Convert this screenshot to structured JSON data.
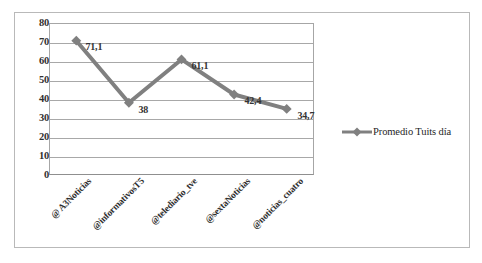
{
  "chart_data": {
    "type": "line",
    "title": "",
    "subtitle": "",
    "xlabel": "",
    "ylabel": "",
    "categories": [
      "@ A3Noticias",
      "@informativosT5",
      "@telediario_tve",
      "@sextaNoticias",
      "@noticias_cuatro"
    ],
    "series": [
      {
        "name": "Promedio Tuits día",
        "values": [
          71.1,
          38,
          61.1,
          42.4,
          34.7
        ],
        "value_labels": [
          "71,1",
          "38",
          "61,1",
          "42,4",
          "34,7"
        ],
        "color": "#808080",
        "marker": "diamond"
      }
    ],
    "ylim": [
      0,
      80
    ],
    "ytick_step": 10,
    "ytick_labels": [
      "80",
      "70",
      "60",
      "50",
      "40",
      "30",
      "20",
      "10",
      "0"
    ],
    "grid": true,
    "grid_axis": "y",
    "legend": {
      "position": "right",
      "entries": [
        "Promedio Tuits día"
      ]
    }
  },
  "legend": {
    "series_label": "Promedio Tuits día"
  },
  "colors": {
    "series": "#808080",
    "gridline": "#a8a8a8",
    "axis": "#8f8f8f",
    "frame": "#b9b9b9",
    "text": "#2f2f2f"
  }
}
